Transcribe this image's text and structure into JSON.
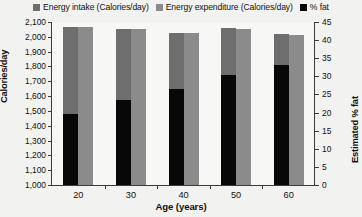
{
  "legend": {
    "items": [
      {
        "label": "Energy intake (Calories/day)",
        "color": "#6e6e6e",
        "icon": "square-swatch-icon"
      },
      {
        "label": "Energy expenditure (Calories/day)",
        "color": "#8b8b8b",
        "icon": "square-swatch-icon"
      },
      {
        "label": "% fat",
        "color": "#080808",
        "icon": "square-swatch-icon"
      }
    ]
  },
  "chart_data": {
    "type": "bar",
    "title": "",
    "categories": [
      "20",
      "30",
      "40",
      "50",
      "60"
    ],
    "xlabel": "Age (years)",
    "ylabel": "Calories/day",
    "ylabel_right": "Estimated % fat",
    "ylim": [
      1000,
      2100
    ],
    "ylim_right": [
      0,
      45
    ],
    "yticks": [
      "2,100",
      "2,000",
      "1,900",
      "1,800",
      "1,700",
      "1,600",
      "1,500",
      "1,400",
      "1,300",
      "1,200",
      "1,100",
      "1,000"
    ],
    "ytick_values": [
      2100,
      2000,
      1900,
      1800,
      1700,
      1600,
      1500,
      1400,
      1300,
      1200,
      1100,
      1000
    ],
    "rticks": [
      "45",
      "40",
      "35",
      "30",
      "25",
      "20",
      "15",
      "10",
      "5",
      "0"
    ],
    "rtick_values": [
      45,
      40,
      35,
      30,
      25,
      20,
      15,
      10,
      5,
      0
    ],
    "grid": false,
    "legend_position": "top",
    "series": [
      {
        "name": "Energy intake (Calories/day)",
        "axis": "left",
        "color": "#6e6e6e",
        "values": [
          2065,
          2050,
          2025,
          2060,
          2020
        ]
      },
      {
        "name": "Energy expenditure (Calories/day)",
        "axis": "left",
        "color": "#8b8b8b",
        "values": [
          2065,
          2050,
          2025,
          2055,
          2015
        ]
      },
      {
        "name": "% fat",
        "axis": "right",
        "color": "#080808",
        "values": [
          19.5,
          23.5,
          26.5,
          30.5,
          33.0
        ]
      }
    ]
  }
}
